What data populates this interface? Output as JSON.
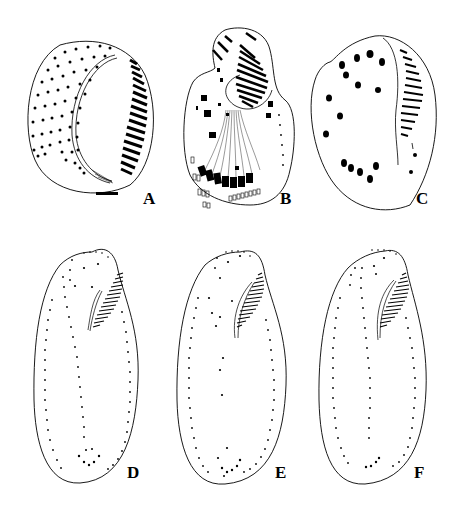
{
  "figure": {
    "background": "#ffffff",
    "ink": "#000000",
    "panels": [
      {
        "id": "A",
        "label": "A",
        "label_pos": [
          143,
          190
        ],
        "description": "ventral view, oral apparatus with adoral membranelles, dorsal kineties"
      },
      {
        "id": "B",
        "label": "B",
        "label_pos": [
          280,
          190
        ],
        "description": "ciliature with frontoventral and transverse cirri, fibers"
      },
      {
        "id": "C",
        "label": "C",
        "label_pos": [
          416,
          190
        ],
        "description": "cirral pattern with membranelles"
      },
      {
        "id": "D",
        "label": "D",
        "label_pos": [
          127,
          464
        ],
        "description": "elongate cell, dotted kineties"
      },
      {
        "id": "E",
        "label": "E",
        "label_pos": [
          275,
          464
        ],
        "description": "elongate cell, dotted kineties"
      },
      {
        "id": "F",
        "label": "F",
        "label_pos": [
          414,
          464
        ],
        "description": "elongate cell, dotted kineties"
      }
    ]
  }
}
